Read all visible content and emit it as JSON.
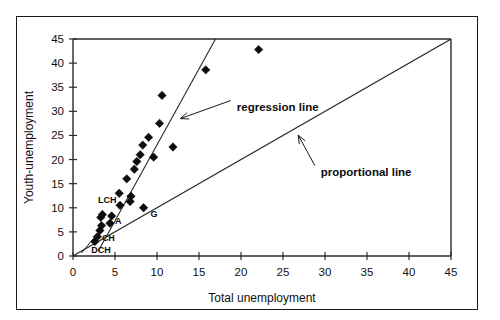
{
  "figure": {
    "border_color": "#1a1a1a",
    "background": "#ffffff"
  },
  "chart_data": {
    "type": "scatter",
    "title": "",
    "xlabel": "Total unemployment",
    "ylabel": "Youth-unemployment",
    "xlim": [
      0,
      45
    ],
    "ylim": [
      0,
      45
    ],
    "xticks": [
      0,
      5,
      10,
      15,
      20,
      25,
      30,
      35,
      40,
      45
    ],
    "yticks": [
      0,
      5,
      10,
      15,
      20,
      25,
      30,
      35,
      40,
      45
    ],
    "xticklabels": [
      "0",
      "5",
      "10",
      "15",
      "20",
      "25",
      "30",
      "35",
      "40",
      "45"
    ],
    "yticklabels": [
      "0",
      "5",
      "10",
      "15",
      "20",
      "25",
      "30",
      "35",
      "40",
      "45"
    ],
    "grid": false,
    "legend_position": "none",
    "marker": "diamond",
    "marker_color": "#0d0d0d",
    "points": [
      {
        "x": 2.6,
        "y": 3.0,
        "label": ""
      },
      {
        "x": 2.9,
        "y": 4.0,
        "label": "DCH"
      },
      {
        "x": 3.2,
        "y": 5.3,
        "label": "CH"
      },
      {
        "x": 3.4,
        "y": 6.3,
        "label": ""
      },
      {
        "x": 3.3,
        "y": 8.0,
        "label": ""
      },
      {
        "x": 3.5,
        "y": 8.6,
        "label": ""
      },
      {
        "x": 4.4,
        "y": 6.8,
        "label": "A"
      },
      {
        "x": 4.6,
        "y": 8.3,
        "label": ""
      },
      {
        "x": 5.6,
        "y": 10.5,
        "label": "LCH"
      },
      {
        "x": 5.5,
        "y": 13.0,
        "label": ""
      },
      {
        "x": 6.4,
        "y": 16.0,
        "label": ""
      },
      {
        "x": 6.8,
        "y": 11.3,
        "label": ""
      },
      {
        "x": 6.9,
        "y": 12.4,
        "label": ""
      },
      {
        "x": 7.3,
        "y": 18.0,
        "label": ""
      },
      {
        "x": 7.6,
        "y": 19.6,
        "label": ""
      },
      {
        "x": 8.0,
        "y": 21.0,
        "label": ""
      },
      {
        "x": 8.4,
        "y": 10.0,
        "label": "G"
      },
      {
        "x": 8.3,
        "y": 23.0,
        "label": ""
      },
      {
        "x": 9.0,
        "y": 24.6,
        "label": ""
      },
      {
        "x": 9.6,
        "y": 20.5,
        "label": ""
      },
      {
        "x": 10.3,
        "y": 27.5,
        "label": ""
      },
      {
        "x": 10.6,
        "y": 33.3,
        "label": ""
      },
      {
        "x": 11.9,
        "y": 22.6,
        "label": ""
      },
      {
        "x": 15.8,
        "y": 38.6,
        "label": ""
      },
      {
        "x": 22.1,
        "y": 42.8,
        "label": ""
      }
    ],
    "lines": [
      {
        "name": "regression line",
        "x": [
          3.0,
          17.6
        ],
        "y": [
          1.0,
          47.0
        ],
        "annotation": "regression line",
        "annotation_x": 19.5,
        "annotation_y": 31.0
      },
      {
        "name": "proportional line",
        "x": [
          0,
          45
        ],
        "y": [
          0,
          45
        ],
        "annotation": "proportional line",
        "annotation_x": 29.5,
        "annotation_y": 17.5
      }
    ]
  }
}
